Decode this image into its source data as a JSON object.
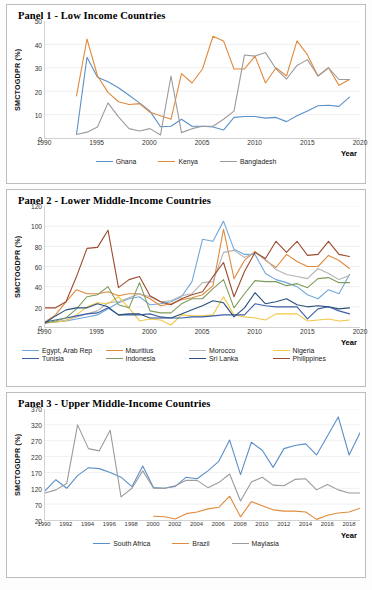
{
  "panels": [
    {
      "title": "Panel 1 - Low Income Countries",
      "ylabel": "SMCTOGDPR (%)",
      "xlabel": "Year"
    },
    {
      "title": "Panel 2 - Lower Middle-Income Countries",
      "ylabel": "SMCTOGDPR (%)",
      "xlabel": "Year"
    },
    {
      "title": "Panel 3 - Upper Middle-Income Countries",
      "ylabel": "SMCTOGDPR (%)",
      "xlabel": "Year"
    }
  ],
  "chart_data": [
    {
      "type": "line",
      "title": "Panel 1 - Low Income Countries",
      "xlabel": "Year",
      "ylabel": "SMCTOGDPR (%)",
      "xlim": [
        1990,
        2020
      ],
      "ylim": [
        0,
        50
      ],
      "yticks": [
        0,
        10,
        20,
        30,
        40,
        50
      ],
      "xticks": [
        1990,
        1995,
        2000,
        2005,
        2010,
        2015,
        2020
      ],
      "grid": true,
      "legend_position": "bottom",
      "series": [
        {
          "name": "Ghana",
          "color": "#5b8fc9",
          "x": [
            1993,
            1994,
            1995,
            1996,
            1997,
            1998,
            1999,
            2000,
            2001,
            2002,
            2003,
            2004,
            2005,
            2006,
            2007,
            2008,
            2009,
            2010,
            2011,
            2012,
            2013,
            2014,
            2015,
            2016,
            2017,
            2018,
            2019
          ],
          "values": [
            1.5,
            34.5,
            26.0,
            24.0,
            21.5,
            18.3,
            15.0,
            11.5,
            4.8,
            5.0,
            8.0,
            5.0,
            5.0,
            4.7,
            3.4,
            8.8,
            9.2,
            9.2,
            8.5,
            8.8,
            7.0,
            9.5,
            11.5,
            13.8,
            14.0,
            13.5,
            17.5
          ]
        },
        {
          "name": "Kenya",
          "color": "#e08a3e",
          "x": [
            1993,
            1994,
            1995,
            1996,
            1997,
            1998,
            1999,
            2000,
            2001,
            2002,
            2003,
            2004,
            2005,
            2006,
            2007,
            2008,
            2009,
            2010,
            2011,
            2012,
            2013,
            2014,
            2015,
            2016,
            2017,
            2018,
            2019
          ],
          "values": [
            18.0,
            42.3,
            26.5,
            19.5,
            15.5,
            14.3,
            14.7,
            11.0,
            9.5,
            8.0,
            27.5,
            23.5,
            29.5,
            43.5,
            41.5,
            29.5,
            29.5,
            35.0,
            23.5,
            30.0,
            26.5,
            41.5,
            35.5,
            26.5,
            30.0,
            22.5,
            25.0
          ]
        },
        {
          "name": "Bangladesh",
          "color": "#9b9b9b",
          "x": [
            1993,
            1994,
            1995,
            1996,
            1997,
            1998,
            1999,
            2000,
            2001,
            2002,
            2003,
            2004,
            2005,
            2006,
            2007,
            2008,
            2009,
            2010,
            2011,
            2012,
            2013,
            2014,
            2015,
            2016,
            2017,
            2018,
            2019
          ],
          "values": [
            1.5,
            2.5,
            4.7,
            15.0,
            9.0,
            4.0,
            3.0,
            4.0,
            1.3,
            26.5,
            2.3,
            4.0,
            5.0,
            5.0,
            8.0,
            11.5,
            35.5,
            35.0,
            36.5,
            29.5,
            25.2,
            31.0,
            33.5,
            26.5,
            30.0,
            25.0,
            25.0
          ]
        }
      ]
    },
    {
      "type": "line",
      "title": "Panel 2 - Lower Middle-Income Countries",
      "xlabel": "Year",
      "ylabel": "SMCTOGDPR (%)",
      "xlim": [
        1990,
        2020
      ],
      "ylim": [
        0,
        120
      ],
      "yticks": [
        0,
        20,
        40,
        60,
        80,
        100,
        120
      ],
      "xticks": [
        1990,
        1995,
        2000,
        2005,
        2010,
        2015,
        2020
      ],
      "grid": true,
      "legend_position": "bottom",
      "series": [
        {
          "name": "Egypt, Arab Rep",
          "color": "#6fa8dc",
          "x": [
            1990,
            1991,
            1992,
            1993,
            1994,
            1995,
            1996,
            1997,
            1998,
            1999,
            2000,
            2001,
            2002,
            2003,
            2004,
            2005,
            2006,
            2007,
            2008,
            2009,
            2010,
            2011,
            2012,
            2013,
            2014,
            2015,
            2016,
            2017,
            2018,
            2019
          ],
          "values": [
            4,
            5,
            6,
            8,
            10,
            12,
            18,
            24,
            28,
            30,
            22,
            23,
            25,
            30,
            45,
            87,
            85,
            105,
            77,
            72,
            72,
            53,
            47,
            44,
            40,
            32,
            28,
            37,
            33,
            52
          ]
        },
        {
          "name": "Mauritius",
          "color": "#e08a3e",
          "x": [
            1990,
            1991,
            1992,
            1993,
            1994,
            1995,
            1996,
            1997,
            1998,
            1999,
            2000,
            2001,
            2002,
            2003,
            2004,
            2005,
            2006,
            2007,
            2008,
            2009,
            2010,
            2011,
            2012,
            2013,
            2014,
            2015,
            2016,
            2017,
            2018,
            2019
          ],
          "values": [
            5,
            12,
            25,
            37,
            33,
            33,
            35,
            31,
            33,
            33,
            28,
            21,
            23,
            27,
            29,
            32,
            41,
            97,
            48,
            66,
            75,
            66,
            59,
            72,
            65,
            60,
            60,
            71,
            66,
            58
          ]
        },
        {
          "name": "Morocco",
          "color": "#b3b3b3",
          "x": [
            1990,
            1991,
            1992,
            1993,
            1994,
            1995,
            1996,
            1997,
            1998,
            1999,
            2000,
            2001,
            2002,
            2003,
            2004,
            2005,
            2006,
            2007,
            2008,
            2009,
            2010,
            2011,
            2012,
            2013,
            2014,
            2015,
            2016,
            2017,
            2018,
            2019
          ],
          "values": [
            4,
            5,
            7,
            10,
            13,
            16,
            24,
            25,
            29,
            33,
            30,
            25,
            26,
            31,
            33,
            44,
            45,
            74,
            76,
            69,
            74,
            67,
            57,
            52,
            50,
            48,
            58,
            53,
            47,
            51
          ]
        },
        {
          "name": "Nigeria",
          "color": "#f0c846",
          "x": [
            1990,
            1991,
            1992,
            1993,
            1994,
            1995,
            1996,
            1997,
            1998,
            1999,
            2000,
            2001,
            2002,
            2003,
            2004,
            2005,
            2006,
            2007,
            2008,
            2009,
            2010,
            2011,
            2012,
            2013,
            2014,
            2015,
            2016,
            2017,
            2018,
            2019
          ],
          "values": [
            4,
            5,
            6,
            12,
            20,
            24,
            23,
            30,
            19,
            6,
            8,
            7,
            2,
            12,
            11,
            11,
            12,
            30,
            12,
            10,
            9,
            7,
            13,
            13,
            13,
            6,
            7,
            8,
            6,
            7
          ]
        },
        {
          "name": "Tunisia",
          "color": "#3d5fa8",
          "x": [
            1990,
            1991,
            1992,
            1993,
            1994,
            1995,
            1996,
            1997,
            1998,
            1999,
            2000,
            2001,
            2002,
            2003,
            2004,
            2005,
            2006,
            2007,
            2008,
            2009,
            2010,
            2011,
            2012,
            2013,
            2014,
            2015,
            2016,
            2017,
            2018,
            2019
          ],
          "values": [
            5,
            7,
            9,
            11,
            13,
            14,
            19,
            12,
            12,
            12,
            13,
            10,
            9,
            9,
            10,
            10,
            11,
            12,
            12,
            12,
            23,
            21,
            20,
            20,
            20,
            8,
            18,
            20,
            16,
            13
          ]
        },
        {
          "name": "Indonesia",
          "color": "#7d9b5a",
          "x": [
            1990,
            1991,
            1992,
            1993,
            1994,
            1995,
            1996,
            1997,
            1998,
            1999,
            2000,
            2001,
            2002,
            2003,
            2004,
            2005,
            2006,
            2007,
            2008,
            2009,
            2010,
            2011,
            2012,
            2013,
            2014,
            2015,
            2016,
            2017,
            2018,
            2019
          ],
          "values": [
            4,
            6,
            9,
            18,
            30,
            32,
            40,
            22,
            19,
            44,
            16,
            14,
            14,
            23,
            28,
            28,
            38,
            47,
            19,
            33,
            46,
            45,
            45,
            41,
            43,
            39,
            48,
            49,
            44,
            44
          ]
        },
        {
          "name": "Sri Lanka",
          "color": "#28507a",
          "x": [
            1990,
            1991,
            1992,
            1993,
            1994,
            1995,
            1996,
            1997,
            1998,
            1999,
            2000,
            2001,
            2002,
            2003,
            2004,
            2005,
            2006,
            2007,
            2008,
            2009,
            2010,
            2011,
            2012,
            2013,
            2014,
            2015,
            2016,
            2017,
            2018,
            2019
          ],
          "values": [
            4,
            11,
            17,
            19,
            19,
            23,
            20,
            12,
            13,
            13,
            9,
            9,
            9,
            13,
            17,
            21,
            26,
            24,
            10,
            19,
            34,
            23,
            25,
            28,
            22,
            20,
            21,
            20,
            18,
            19
          ]
        },
        {
          "name": "Philippines",
          "color": "#9c4a31",
          "x": [
            1990,
            1991,
            1992,
            1993,
            1994,
            1995,
            1996,
            1997,
            1998,
            1999,
            2000,
            2001,
            2002,
            2003,
            2004,
            2005,
            2006,
            2007,
            2008,
            2009,
            2010,
            2011,
            2012,
            2013,
            2014,
            2015,
            2016,
            2017,
            2018,
            2019
          ],
          "values": [
            19,
            19,
            25,
            50,
            78,
            79,
            96,
            39,
            47,
            50,
            31,
            25,
            22,
            28,
            32,
            35,
            50,
            64,
            30,
            55,
            74,
            68,
            85,
            74,
            85,
            71,
            72,
            85,
            72,
            70
          ]
        }
      ]
    },
    {
      "type": "line",
      "title": "Panel 3 - Upper Middle-Income Countries",
      "xlabel": "Year",
      "ylabel": "SMCTOGDPR (%)",
      "xlim": [
        1990,
        2019
      ],
      "ylim": [
        20,
        370
      ],
      "yticks": [
        20,
        70,
        120,
        170,
        220,
        270,
        320,
        370
      ],
      "xticks": [
        1990,
        1992,
        1994,
        1996,
        1998,
        2000,
        2002,
        2004,
        2006,
        2008,
        2010,
        2012,
        2014,
        2016,
        2018
      ],
      "grid": true,
      "legend_position": "bottom",
      "series": [
        {
          "name": "South Africa",
          "color": "#5b8fc9",
          "x": [
            1990,
            1991,
            1992,
            1993,
            1994,
            1995,
            1996,
            1997,
            1998,
            1999,
            2000,
            2001,
            2002,
            2003,
            2004,
            2005,
            2006,
            2007,
            2008,
            2009,
            2010,
            2011,
            2012,
            2013,
            2014,
            2015,
            2016,
            2017,
            2018,
            2019
          ],
          "values": [
            112,
            147,
            120,
            160,
            185,
            182,
            170,
            155,
            125,
            190,
            122,
            120,
            126,
            155,
            150,
            175,
            205,
            272,
            163,
            265,
            240,
            186,
            245,
            255,
            260,
            225,
            285,
            345,
            225,
            295
          ]
        },
        {
          "name": "Brazil",
          "color": "#e08a3e",
          "x": [
            2000,
            2001,
            2002,
            2003,
            2004,
            2005,
            2006,
            2007,
            2008,
            2009,
            2010,
            2011,
            2012,
            2013,
            2014,
            2015,
            2016,
            2017,
            2018,
            2019
          ],
          "values": [
            32,
            30,
            23,
            40,
            45,
            55,
            60,
            95,
            30,
            78,
            65,
            52,
            48,
            48,
            45,
            22,
            35,
            42,
            45,
            57
          ]
        },
        {
          "name": "Maylasia",
          "color": "#9b9b9b",
          "x": [
            1990,
            1991,
            1992,
            1993,
            1994,
            1995,
            1996,
            1997,
            1998,
            1999,
            2000,
            2001,
            2002,
            2003,
            2004,
            2005,
            2006,
            2007,
            2008,
            2009,
            2010,
            2011,
            2012,
            2013,
            2014,
            2015,
            2016,
            2017,
            2018,
            2019
          ],
          "values": [
            105,
            115,
            135,
            320,
            245,
            238,
            303,
            93,
            120,
            175,
            120,
            120,
            128,
            145,
            145,
            122,
            138,
            165,
            80,
            140,
            155,
            130,
            128,
            148,
            150,
            115,
            132,
            115,
            105,
            105
          ]
        }
      ]
    }
  ]
}
